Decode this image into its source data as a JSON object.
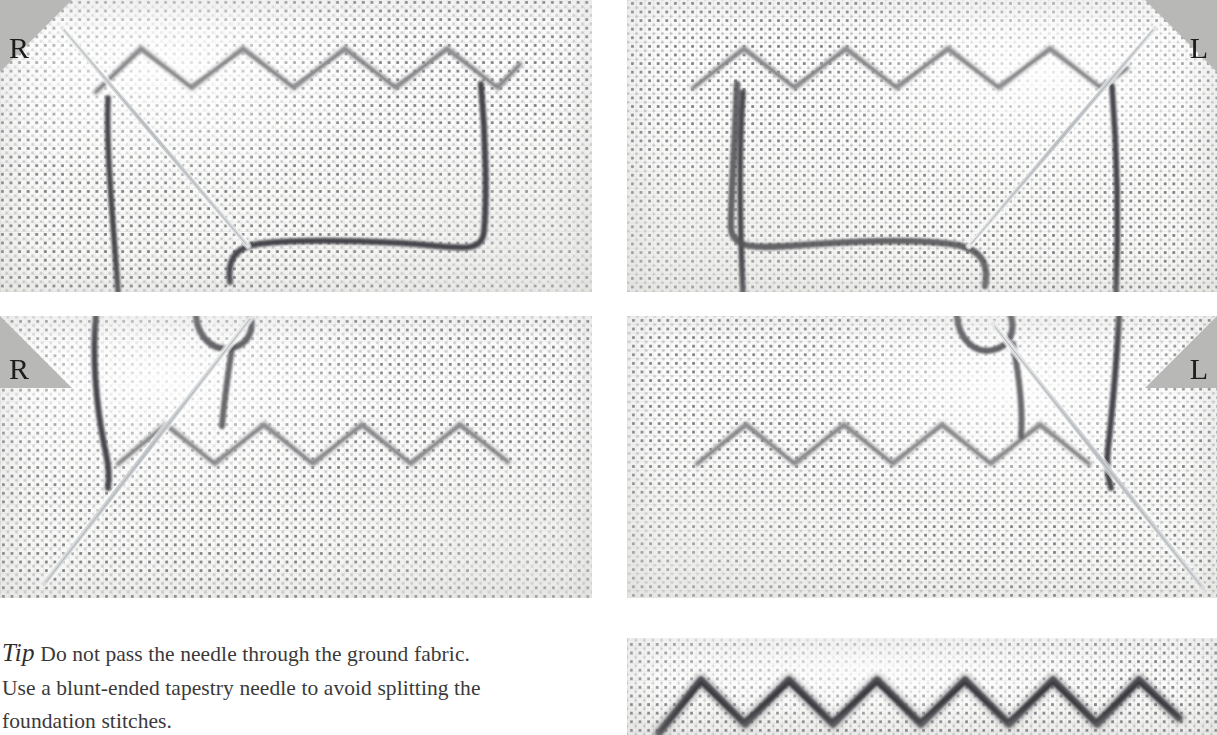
{
  "page": {
    "background": "#ffffff",
    "width": 1217,
    "height": 735
  },
  "colors": {
    "fabric": "#fbfbfa",
    "fabric_dot": "#3a3d42",
    "working_thread": "#4a4a4c",
    "foundation_thread": "#9d9d9f",
    "needle": "#c9cbcd",
    "tab_gray": "#b8b8b6",
    "text": "#3a3a3a"
  },
  "corner_tabs": [
    {
      "name": "tab-top-left",
      "label": "R",
      "side": "left",
      "panel": "step-1"
    },
    {
      "name": "tab-top-right",
      "label": "L",
      "side": "right",
      "panel": "step-2"
    },
    {
      "name": "tab-middle-left",
      "label": "R",
      "side": "left",
      "panel": "step-3"
    },
    {
      "name": "tab-middle-right",
      "label": "L",
      "side": "right",
      "panel": "step-4"
    }
  ],
  "panels": [
    {
      "id": "step-1",
      "name": "photo-step-1",
      "position": "top-left",
      "alt": "Needle angled down-right beneath a pale zigzag foundation row; dark working thread loops below",
      "needle": "down-right",
      "zigzag_peaks": 7
    },
    {
      "id": "step-2",
      "name": "photo-step-2",
      "position": "top-right",
      "alt": "Mirror image: needle angled up-right beneath a pale zigzag foundation row with dark working thread",
      "needle": "up-right",
      "zigzag_peaks": 7
    },
    {
      "id": "step-3",
      "name": "photo-step-3",
      "position": "middle-left",
      "alt": "Long tapestry needle slipped under the zigzag foundation row from lower left",
      "needle": "long-down-left",
      "zigzag_peaks": 7
    },
    {
      "id": "step-4",
      "name": "photo-step-4",
      "position": "middle-right",
      "alt": "Mirror image: long tapestry needle slipped under the zigzag foundation row from lower right",
      "needle": "long-down-right",
      "zigzag_peaks": 7
    },
    {
      "id": "step-5",
      "name": "photo-step-5-finished",
      "position": "bottom-right",
      "alt": "Finished row of dark chevron stitches worked over the foundation",
      "needle": "none",
      "zigzag_peaks": 6
    }
  ],
  "tip": {
    "keyword": "Tip",
    "line1": "Do not pass the needle through the ground fabric.",
    "line2": "Use a blunt-ended tapestry needle to avoid splitting the",
    "line3": "foundation stitches."
  }
}
